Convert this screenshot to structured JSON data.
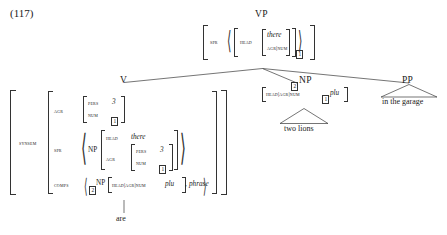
{
  "example": {
    "number": "(117)"
  },
  "tree": {
    "root": {
      "label": "VP",
      "avm": {
        "spr_label": "SPR",
        "list": [
          {
            "head_label": "HEAD",
            "head_value_italic": "there",
            "agr_path": "AGR|NUM",
            "agr_tag": "1"
          }
        ]
      }
    },
    "children": [
      {
        "label": "V",
        "word": "are",
        "avm": {
          "synsem_label": "SYNSEM",
          "features": [
            {
              "name": "AGR",
              "rows": [
                {
                  "label": "PERS",
                  "value": "3",
                  "italic": true,
                  "tag": null
                },
                {
                  "label": "NUM",
                  "value": null,
                  "italic": false,
                  "tag": "1"
                }
              ]
            },
            {
              "name": "SPR",
              "list_item": {
                "cat": "NP",
                "rows": [
                  {
                    "label": "HEAD",
                    "value": "there",
                    "italic": true
                  },
                  {
                    "label": "AGR",
                    "nested": [
                      {
                        "label": "PERS",
                        "value": "3",
                        "italic": true,
                        "tag": null
                      },
                      {
                        "label": "NUM",
                        "value": null,
                        "italic": false,
                        "tag": "1"
                      }
                    ]
                  }
                ]
              }
            },
            {
              "name": "COMPS",
              "list_items": [
                {
                  "tag": "2",
                  "cat": "NP",
                  "path": "HEAD|AGR|NUM",
                  "value": "plu",
                  "italic": true
                },
                {
                  "type_italic": "phrase"
                }
              ]
            }
          ]
        }
      },
      {
        "label": "NP",
        "tag": "2",
        "avm": {
          "path": "HEAD|AGR|NUM",
          "tag": "1",
          "value": "plu"
        },
        "triangle_text": "two lions"
      },
      {
        "label": "PP",
        "triangle_text": "in the garage"
      }
    ]
  }
}
